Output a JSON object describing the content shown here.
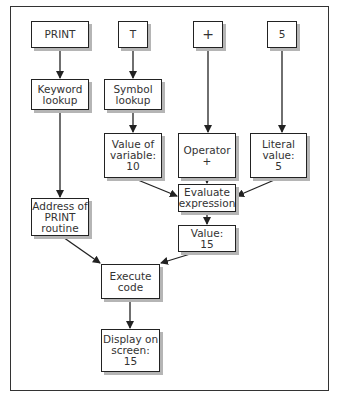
{
  "diagram": {
    "type": "flowchart",
    "title": "",
    "nodes": [
      {
        "id": "print",
        "label": "PRINT"
      },
      {
        "id": "t",
        "label": "T"
      },
      {
        "id": "plus",
        "label": "+"
      },
      {
        "id": "five",
        "label": "5"
      },
      {
        "id": "keyword",
        "label": "Keyword\nlookup"
      },
      {
        "id": "symbol",
        "label": "Symbol\nlookup"
      },
      {
        "id": "varval",
        "label": "Value of\nvariable:\n10"
      },
      {
        "id": "operator",
        "label": "Operator\n+"
      },
      {
        "id": "literal",
        "label": "Literal\nvalue:\n5"
      },
      {
        "id": "evaluate",
        "label": "Evaluate\nexpression"
      },
      {
        "id": "address",
        "label": "Address of\nPRINT\nroutine"
      },
      {
        "id": "value15",
        "label": "Value:\n15"
      },
      {
        "id": "execute",
        "label": "Execute\ncode"
      },
      {
        "id": "display",
        "label": "Display on\nscreen:\n15"
      }
    ],
    "edges": [
      [
        "print",
        "keyword"
      ],
      [
        "t",
        "symbol"
      ],
      [
        "plus",
        "operator"
      ],
      [
        "five",
        "literal"
      ],
      [
        "keyword",
        "address"
      ],
      [
        "symbol",
        "varval"
      ],
      [
        "varval",
        "evaluate"
      ],
      [
        "operator",
        "evaluate"
      ],
      [
        "literal",
        "evaluate"
      ],
      [
        "evaluate",
        "value15"
      ],
      [
        "address",
        "execute"
      ],
      [
        "value15",
        "execute"
      ],
      [
        "execute",
        "display"
      ]
    ]
  }
}
